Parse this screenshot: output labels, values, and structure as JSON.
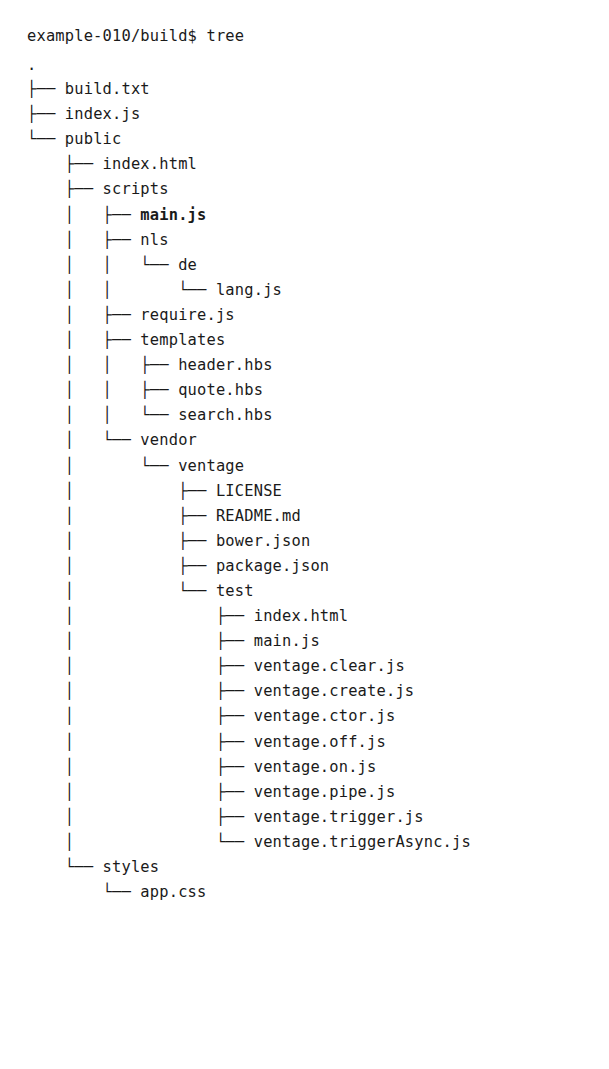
{
  "terminal": {
    "prompt": "example-010/build$ tree",
    "command": "tree",
    "cwd": "example-010/build$",
    "root": "."
  },
  "tree": {
    "lines": [
      {
        "prefix": "├── ",
        "name": "build.txt",
        "bold": false
      },
      {
        "prefix": "├── ",
        "name": "index.js",
        "bold": false
      },
      {
        "prefix": "└── ",
        "name": "public",
        "bold": false
      },
      {
        "prefix": "    ├── ",
        "name": "index.html",
        "bold": false
      },
      {
        "prefix": "    ├── ",
        "name": "scripts",
        "bold": false
      },
      {
        "prefix": "    │   ├── ",
        "name": "main.js",
        "bold": true
      },
      {
        "prefix": "    │   ├── ",
        "name": "nls",
        "bold": false
      },
      {
        "prefix": "    │   │   └── ",
        "name": "de",
        "bold": false
      },
      {
        "prefix": "    │   │       └── ",
        "name": "lang.js",
        "bold": false
      },
      {
        "prefix": "    │   ├── ",
        "name": "require.js",
        "bold": false
      },
      {
        "prefix": "    │   ├── ",
        "name": "templates",
        "bold": false
      },
      {
        "prefix": "    │   │   ├── ",
        "name": "header.hbs",
        "bold": false
      },
      {
        "prefix": "    │   │   ├── ",
        "name": "quote.hbs",
        "bold": false
      },
      {
        "prefix": "    │   │   └── ",
        "name": "search.hbs",
        "bold": false
      },
      {
        "prefix": "    │   └── ",
        "name": "vendor",
        "bold": false
      },
      {
        "prefix": "    │       └── ",
        "name": "ventage",
        "bold": false
      },
      {
        "prefix": "    │           ├── ",
        "name": "LICENSE",
        "bold": false
      },
      {
        "prefix": "    │           ├── ",
        "name": "README.md",
        "bold": false
      },
      {
        "prefix": "    │           ├── ",
        "name": "bower.json",
        "bold": false
      },
      {
        "prefix": "    │           ├── ",
        "name": "package.json",
        "bold": false
      },
      {
        "prefix": "    │           └── ",
        "name": "test",
        "bold": false
      },
      {
        "prefix": "    │               ├── ",
        "name": "index.html",
        "bold": false
      },
      {
        "prefix": "    │               ├── ",
        "name": "main.js",
        "bold": false
      },
      {
        "prefix": "    │               ├── ",
        "name": "ventage.clear.js",
        "bold": false
      },
      {
        "prefix": "    │               ├── ",
        "name": "ventage.create.js",
        "bold": false
      },
      {
        "prefix": "    │               ├── ",
        "name": "ventage.ctor.js",
        "bold": false
      },
      {
        "prefix": "    │               ├── ",
        "name": "ventage.off.js",
        "bold": false
      },
      {
        "prefix": "    │               ├── ",
        "name": "ventage.on.js",
        "bold": false
      },
      {
        "prefix": "    │               ├── ",
        "name": "ventage.pipe.js",
        "bold": false
      },
      {
        "prefix": "    │               ├── ",
        "name": "ventage.trigger.js",
        "bold": false
      },
      {
        "prefix": "    │               └── ",
        "name": "ventage.triggerAsync.js",
        "bold": false
      },
      {
        "prefix": "    └── ",
        "name": "styles",
        "bold": false
      },
      {
        "prefix": "        └── ",
        "name": "app.css",
        "bold": false
      }
    ]
  },
  "colors": {
    "background": "#ffffff",
    "ink": "#1a1a1a"
  }
}
